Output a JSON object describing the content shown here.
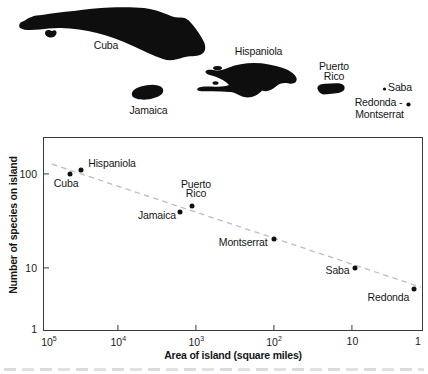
{
  "figure": {
    "kind": "species-area figure: Caribbean island map above a log-log scatter plot",
    "colors": {
      "island_fill": "#0e0e0e",
      "axis": "#3a3a3a",
      "trend": "#bdbdbd",
      "text": "#161616"
    }
  },
  "map": {
    "islands": [
      "Cuba",
      "Isle of Youth",
      "Jamaica",
      "Hispaniola",
      "Tortuga",
      "Gonave",
      "Puerto Rico",
      "Saba",
      "Redonda",
      "Montserrat"
    ],
    "labels": [
      {
        "id": "cuba",
        "text": "Cuba",
        "x": 106,
        "y": 46
      },
      {
        "id": "hispaniola",
        "text": "Hispaniola",
        "x": 258.5,
        "y": 52
      },
      {
        "id": "jamaica",
        "text": "Jamaica",
        "x": 148.5,
        "y": 111
      },
      {
        "id": "puerto-rico",
        "text": "Puerto\nRico",
        "x": 334,
        "y": 72
      },
      {
        "id": "saba",
        "text": "Saba",
        "x": 400,
        "y": 87.5
      },
      {
        "id": "redonda",
        "text": "Redonda -",
        "x": 378.5,
        "y": 102.5
      },
      {
        "id": "montserrat",
        "text": "Montserrat",
        "x": 379.5,
        "y": 114.5
      }
    ]
  },
  "chart_data": {
    "type": "scatter",
    "title": "",
    "xlabel": "Area of island (square miles)",
    "ylabel": "Number of species on island",
    "x_scale": "log, reversed (100000 at left, 1 at right)",
    "y_scale": "log",
    "xlim": [
      100000,
      1
    ],
    "ylim": [
      1,
      200
    ],
    "grid": false,
    "x_ticks": [
      {
        "base": "10",
        "exp": "5"
      },
      {
        "base": "10",
        "exp": "4"
      },
      {
        "base": "10",
        "exp": "3"
      },
      {
        "base": "10",
        "exp": "2"
      },
      {
        "base": "10",
        "exp": ""
      },
      {
        "base": "1",
        "exp": ""
      }
    ],
    "x_tick_label_fx": [
      0.012,
      0.196,
      0.403,
      0.609,
      0.817,
      0.991
    ],
    "x_tick_marks_fx": [
      0.196,
      0.403,
      0.609,
      0.817
    ],
    "y_ticks": [
      "100",
      "10",
      "1"
    ],
    "y_tick_label_fy": [
      0.186,
      0.68,
      1.0
    ],
    "y_tick_marks_fy": [
      0.186,
      0.68
    ],
    "points": [
      {
        "id": "cuba",
        "label": "Cuba",
        "area_sq_mi": 45000,
        "species": 100,
        "fx": 0.0692,
        "fy": 0.1881,
        "ldx": -4,
        "ldy": 10
      },
      {
        "id": "hispaniola",
        "label": "Hispaniola",
        "area_sq_mi": 30000,
        "species": 110,
        "fx": 0.0982,
        "fy": 0.1675,
        "ldx": 31,
        "ldy": -6
      },
      {
        "id": "jamaica",
        "label": "Jamaica",
        "area_sq_mi": 1600,
        "species": 40,
        "fx": 0.3605,
        "fy": 0.3866,
        "ldx": -23,
        "ldy": 4.5
      },
      {
        "id": "puerto-rico",
        "label": "Puerto\nRico",
        "area_sq_mi": 1100,
        "species": 45,
        "fx": 0.3913,
        "fy": 0.3572,
        "ldx": 4.5,
        "ldy": -16.5
      },
      {
        "id": "montserrat",
        "label": "Montserrat",
        "area_sq_mi": 100,
        "species": 20,
        "fx": 0.6105,
        "fy": 0.5284,
        "ldx": -31,
        "ldy": 4
      },
      {
        "id": "saba",
        "label": "Saba",
        "area_sq_mi": 9,
        "species": 10,
        "fx": 0.8237,
        "fy": 0.6818,
        "ldx": -17,
        "ldy": 3
      },
      {
        "id": "redonda",
        "label": "Redonda",
        "area_sq_mi": 1,
        "species": 5,
        "fx": 0.9824,
        "fy": 0.7912,
        "ldx": -26,
        "ldy": 8.5
      }
    ],
    "trendline": {
      "style": "dashed",
      "color": "#bdbdbd",
      "fx1": 0.021,
      "fy1": 0.137,
      "fx2": 1.0,
      "fy2": 0.781
    }
  }
}
